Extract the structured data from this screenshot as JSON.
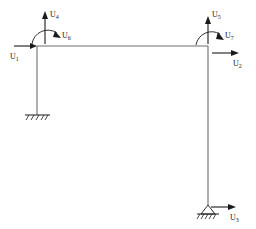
{
  "diagram": {
    "type": "structural-frame-dof-diagram",
    "background_color": "#ffffff",
    "member_color": "#6e6e6e",
    "annotation_color": "#1a1a1a",
    "geometry": {
      "top_left_joint": [
        37,
        46
      ],
      "top_right_joint": [
        208,
        46
      ],
      "left_base": [
        37,
        115
      ],
      "right_base": [
        208,
        207
      ]
    },
    "supports": [
      {
        "name": "left-support",
        "kind": "fixed-hatched-ground",
        "at": [
          37,
          115
        ]
      },
      {
        "name": "right-support",
        "kind": "pin-triangle-hatched-ground",
        "at": [
          208,
          207
        ]
      }
    ],
    "dof_labels": [
      {
        "id": "U1",
        "text": "U",
        "sub": "1",
        "kind": "translation-horizontal",
        "direction": "right",
        "at_joint": "top-left"
      },
      {
        "id": "U2",
        "text": "U",
        "sub": "2",
        "kind": "translation-horizontal",
        "direction": "right",
        "at_joint": "top-right"
      },
      {
        "id": "U3",
        "text": "U",
        "sub": "3",
        "kind": "translation-horizontal",
        "direction": "right",
        "at_joint": "right-base"
      },
      {
        "id": "U4",
        "text": "U",
        "sub": "4",
        "kind": "translation-vertical",
        "direction": "up",
        "at_joint": "top-left"
      },
      {
        "id": "U5",
        "text": "U",
        "sub": "5",
        "kind": "translation-vertical",
        "direction": "up",
        "at_joint": "top-right"
      },
      {
        "id": "U6",
        "text": "U",
        "sub": "6",
        "kind": "rotation-moment",
        "direction": "clockwise",
        "at_joint": "top-left"
      },
      {
        "id": "U7",
        "text": "U",
        "sub": "7",
        "kind": "rotation-moment",
        "direction": "clockwise",
        "at_joint": "top-right"
      }
    ]
  }
}
